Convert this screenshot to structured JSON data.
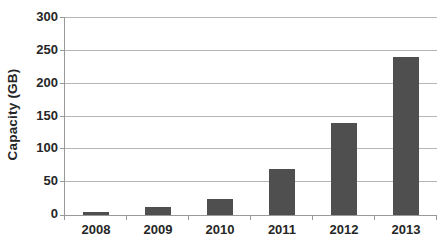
{
  "chart_data": {
    "type": "bar",
    "title": "",
    "xlabel": "",
    "ylabel": "Capacity (GB)",
    "categories": [
      "2008",
      "2009",
      "2010",
      "2011",
      "2012",
      "2013"
    ],
    "values": [
      5,
      12,
      25,
      70,
      140,
      240
    ],
    "ylim": [
      0,
      300
    ],
    "yticks": [
      0,
      50,
      100,
      150,
      200,
      250,
      300
    ],
    "grid": "horizontal",
    "legend": "none",
    "colors": {
      "bar": "#4f4f4f",
      "grid": "#b5b5b5",
      "axis": "#999999",
      "text": "#262626",
      "background": "#ffffff"
    }
  }
}
